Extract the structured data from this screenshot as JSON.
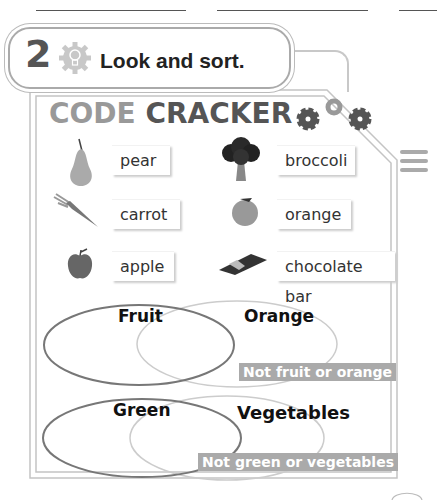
{
  "header": {
    "blank_lines": 3,
    "exercise_number": "2",
    "instruction": "Look and sort.",
    "icon": "lightbulb-gear-icon"
  },
  "code_cracker": {
    "title_part1": "CODE",
    "title_part2": "CRACKER",
    "title_icon": "gears-icon"
  },
  "items": [
    {
      "label": "pear",
      "icon": "pear-icon"
    },
    {
      "label": "broccoli",
      "icon": "broccoli-icon"
    },
    {
      "label": "carrot",
      "icon": "carrot-icon"
    },
    {
      "label": "orange",
      "icon": "orange-icon"
    },
    {
      "label": "apple",
      "icon": "apple-icon"
    },
    {
      "label": "chocolate bar",
      "icon": "chocolate-bar-icon"
    }
  ],
  "venn1": {
    "left_label": "Fruit",
    "right_label": "Orange",
    "outside_label": "Not fruit or orange"
  },
  "venn2": {
    "left_label": "Green",
    "right_label": "Vegetables",
    "outside_label": "Not green or vegetables"
  },
  "colors": {
    "badge": "#aaaaaa",
    "frame": "#bbbbbb",
    "code_text": "#999999",
    "cracker_text": "#555555"
  }
}
